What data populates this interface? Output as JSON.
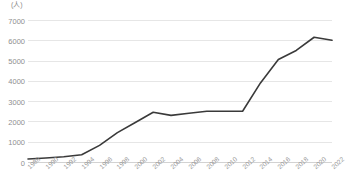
{
  "chart_data": {
    "type": "line",
    "title": "",
    "subtitle": "",
    "xlabel": "",
    "ylabel": "",
    "unit_label": "(人)",
    "grid": "horizontal",
    "legend": "none",
    "ylim": [
      0,
      7000
    ],
    "ytick_step": 1000,
    "yticks": [
      "0",
      "1000",
      "2000",
      "3000",
      "4000",
      "5000",
      "6000",
      "7000"
    ],
    "xlim": [
      1988,
      2022
    ],
    "xticks": [
      "1988",
      "1990",
      "1992",
      "1994",
      "1996",
      "1998",
      "2000",
      "2002",
      "2004",
      "2006",
      "2008",
      "2010",
      "2012",
      "2014",
      "2016",
      "2018",
      "2020",
      "2022"
    ],
    "x": [
      1988,
      1990,
      1992,
      1994,
      1996,
      1998,
      2000,
      2002,
      2004,
      2006,
      2008,
      2010,
      2012,
      2014,
      2016,
      2018,
      2020,
      2022
    ],
    "values": [
      150,
      200,
      260,
      360,
      820,
      1450,
      1950,
      2450,
      2300,
      2400,
      2500,
      2500,
      2500,
      3900,
      5050,
      5500,
      6150,
      6000
    ],
    "series": [
      {
        "name": "",
        "color": "#3a3a3a",
        "values": [
          150,
          200,
          260,
          360,
          820,
          1450,
          1950,
          2450,
          2300,
          2400,
          2500,
          2500,
          2500,
          3900,
          5050,
          5500,
          6150,
          6000
        ]
      }
    ],
    "colors": {
      "line": "#3a3a3a",
      "grid": "#e6e6e6",
      "axis": "#d2d2d2",
      "tick_text": "#8f8f8f",
      "background": "#ffffff"
    }
  }
}
